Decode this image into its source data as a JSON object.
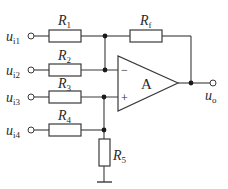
{
  "diagram": {
    "type": "op-amp summing circuit",
    "opamp": {
      "label": "A",
      "inverting_sign": "−",
      "noninverting_sign": "+"
    },
    "inputs": [
      {
        "main": "u",
        "sub": "i1"
      },
      {
        "main": "u",
        "sub": "i2"
      },
      {
        "main": "u",
        "sub": "i3"
      },
      {
        "main": "u",
        "sub": "i4"
      }
    ],
    "output": {
      "main": "u",
      "sub": "o"
    },
    "resistors": [
      {
        "main": "R",
        "sub": "1"
      },
      {
        "main": "R",
        "sub": "2"
      },
      {
        "main": "R",
        "sub": "3"
      },
      {
        "main": "R",
        "sub": "4"
      },
      {
        "main": "R",
        "sub": "5"
      },
      {
        "main": "R",
        "sub": "f"
      }
    ],
    "colors": {
      "line": "#3a3a3a",
      "node": "#1a1a1a",
      "background": "#ffffff"
    }
  }
}
